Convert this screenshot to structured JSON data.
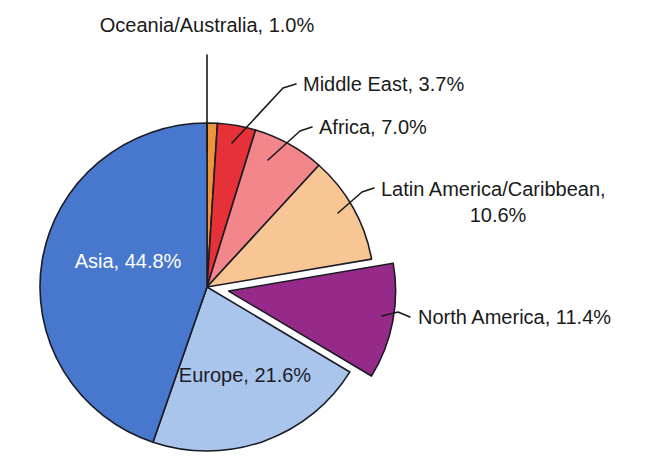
{
  "chart_data": {
    "type": "pie",
    "title": "",
    "subtitle": "",
    "xlabel": "",
    "ylabel": "",
    "legend_position": "none",
    "grid": false,
    "units": "percent",
    "total": 100.1,
    "start_angle_deg": 0,
    "direction": "clockwise",
    "categories": [
      "Oceania/Australia",
      "Middle East",
      "Africa",
      "Latin America/Caribbean",
      "North America",
      "Europe",
      "Asia"
    ],
    "values": [
      1.0,
      3.7,
      7.0,
      10.6,
      11.4,
      21.6,
      44.8
    ],
    "slices": [
      {
        "name": "Oceania/Australia",
        "value": 1.0,
        "value_text": "1.0%",
        "label": "Oceania/Australia, 1.0%",
        "color": "#F0943C",
        "label_placement": "outside",
        "exploded": false
      },
      {
        "name": "Middle East",
        "value": 3.7,
        "value_text": "3.7%",
        "label": "Middle East, 3.7%",
        "color": "#E53137",
        "label_placement": "outside",
        "exploded": false
      },
      {
        "name": "Africa",
        "value": 7.0,
        "value_text": "7.0%",
        "label": "Africa, 7.0%",
        "color": "#F2868A",
        "label_placement": "outside",
        "exploded": false
      },
      {
        "name": "Latin America/Caribbean",
        "value": 10.6,
        "value_text": "10.6%",
        "label": "Latin America/Caribbean, 10.6%",
        "label_line1": "Latin America/Caribbean,",
        "label_line2": "10.6%",
        "color": "#F7C694",
        "label_placement": "outside",
        "exploded": false
      },
      {
        "name": "North America",
        "value": 11.4,
        "value_text": "11.4%",
        "label": "North America, 11.4%",
        "color": "#962A89",
        "label_placement": "outside",
        "exploded": true
      },
      {
        "name": "Europe",
        "value": 21.6,
        "value_text": "21.6%",
        "label": "Europe, 21.6%",
        "color": "#A9C5EC",
        "label_placement": "inside",
        "label_text_color": "#1c1c28",
        "exploded": false
      },
      {
        "name": "Asia",
        "value": 44.8,
        "value_text": "44.8%",
        "label": "Asia, 44.8%",
        "color": "#4878CE",
        "label_placement": "inside",
        "label_text_color": "#ffffff",
        "exploded": false
      }
    ]
  },
  "labels": {
    "oceania": "Oceania/Australia, 1.0%",
    "middle_east": "Middle East, 3.7%",
    "africa": "Africa, 7.0%",
    "latin_america_line1": "Latin America/Caribbean,",
    "latin_america_line2": "10.6%",
    "north_america": "North America, 11.4%",
    "europe": "Europe, 21.6%",
    "asia": "Asia, 44.8%"
  },
  "colors": {
    "oceania": "#F0943C",
    "middle_east": "#E53137",
    "africa": "#F2868A",
    "latin_america": "#F7C694",
    "north_america": "#962A89",
    "europe": "#A9C5EC",
    "asia": "#4878CE",
    "outline": "#1b1b24",
    "text": "#1a1a1a",
    "background": "#ffffff"
  }
}
